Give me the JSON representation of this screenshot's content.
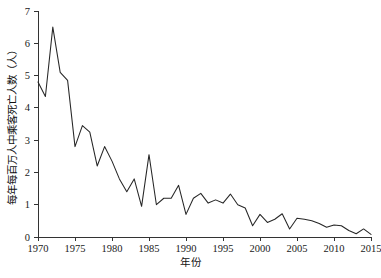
{
  "chart_data": {
    "type": "line",
    "title": "",
    "xlabel": "年份",
    "ylabel": "每年每百万人中乘客死亡人数（人）",
    "xlim": [
      1970,
      2015
    ],
    "ylim": [
      0,
      7
    ],
    "grid": false,
    "legend": false,
    "xticks": [
      1970,
      1975,
      1980,
      1985,
      1990,
      1995,
      2000,
      2005,
      2010,
      2015
    ],
    "xtick_labels": [
      "1970",
      "1975",
      "1980",
      "1985",
      "1990",
      "1995",
      "2000",
      "2005",
      "2010",
      "2015"
    ],
    "yticks": [
      0,
      1,
      2,
      3,
      4,
      5,
      6,
      7
    ],
    "ytick_labels": [
      "0",
      "1",
      "2",
      "3",
      "4",
      "5",
      "6",
      "7"
    ],
    "x": [
      1970,
      1971,
      1972,
      1973,
      1974,
      1975,
      1976,
      1977,
      1978,
      1979,
      1980,
      1981,
      1982,
      1983,
      1984,
      1985,
      1986,
      1987,
      1988,
      1989,
      1990,
      1991,
      1992,
      1993,
      1994,
      1995,
      1996,
      1997,
      1998,
      1999,
      2000,
      2001,
      2002,
      2003,
      2004,
      2005,
      2006,
      2007,
      2008,
      2009,
      2010,
      2011,
      2012,
      2013,
      2014,
      2015
    ],
    "values": [
      4.8,
      4.35,
      6.5,
      5.1,
      4.85,
      2.8,
      3.45,
      3.25,
      2.2,
      2.8,
      2.35,
      1.8,
      1.4,
      1.8,
      0.95,
      2.55,
      1.0,
      1.2,
      1.2,
      1.6,
      0.7,
      1.2,
      1.35,
      1.05,
      1.15,
      1.05,
      1.33,
      1.0,
      0.9,
      0.35,
      0.7,
      0.45,
      0.55,
      0.72,
      0.25,
      0.58,
      0.55,
      0.5,
      0.42,
      0.3,
      0.37,
      0.35,
      0.2,
      0.1,
      0.25,
      0.08
    ],
    "series": [
      {
        "name": "每年每百万人中乘客死亡人数",
        "values": [
          4.8,
          4.35,
          6.5,
          5.1,
          4.85,
          2.8,
          3.45,
          3.25,
          2.2,
          2.8,
          2.35,
          1.8,
          1.4,
          1.8,
          0.95,
          2.55,
          1.0,
          1.2,
          1.2,
          1.6,
          0.7,
          1.2,
          1.35,
          1.05,
          1.15,
          1.05,
          1.33,
          1.0,
          0.9,
          0.35,
          0.7,
          0.45,
          0.55,
          0.72,
          0.25,
          0.58,
          0.55,
          0.5,
          0.42,
          0.3,
          0.37,
          0.35,
          0.2,
          0.1,
          0.25,
          0.08
        ],
        "color": "#262626"
      }
    ]
  },
  "style": {
    "line_color": "#262626",
    "axis_color": "#333333",
    "background": "#ffffff",
    "text_color": "#1a1a1a"
  }
}
